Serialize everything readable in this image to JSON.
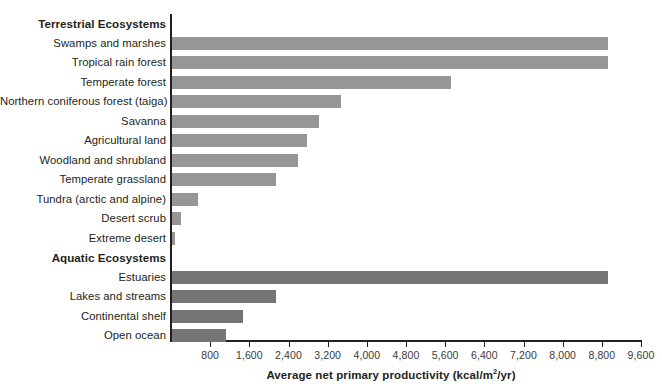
{
  "chart_data": {
    "type": "bar",
    "orientation": "horizontal",
    "title": "",
    "xlabel": "Average net primary productivity (kcal/m2/yr)",
    "xlabel_display": "Average net primary productivity (kcal/m",
    "xlabel_sup": "2",
    "xlabel_tail": "/yr)",
    "ylabel": "",
    "xlim": [
      0,
      9600
    ],
    "grid": false,
    "legend": "none",
    "tick_values": [
      800,
      1600,
      2400,
      3200,
      4000,
      4800,
      5600,
      6400,
      7200,
      8000,
      8800,
      9600
    ],
    "tick_labels": [
      "800",
      "1,600",
      "2,400",
      "3,200",
      "4,000",
      "4,800",
      "5,600",
      "6,400",
      "7,200",
      "8,000",
      "8,800",
      "9,600"
    ],
    "sections": [
      {
        "name": "Terrestrial Ecosystems",
        "group": "terrestrial",
        "color": "#969696"
      },
      {
        "name": "Aquatic Ecosystems",
        "group": "aquatic",
        "color": "#757575"
      }
    ],
    "categories": [
      "Swamps and marshes",
      "Tropical rain forest",
      "Temperate forest",
      "Northern coniferous forest (taiga)",
      "Savanna",
      "Agricultural land",
      "Woodland and shrubland",
      "Temperate grassland",
      "Tundra (arctic and alpine)",
      "Desert scrub",
      "Extreme desert",
      "Estuaries",
      "Lakes and streams",
      "Continental shelf",
      "Open ocean"
    ],
    "values": [
      8900,
      8900,
      5700,
      3450,
      3000,
      2750,
      2570,
      2120,
      530,
      190,
      60,
      8900,
      2120,
      1450,
      1100
    ]
  },
  "rows": [
    {
      "label": "Terrestrial Ecosystems",
      "type": "section",
      "group": "terrestrial"
    },
    {
      "label": "Swamps and marshes",
      "value": 8900,
      "group": "terrestrial"
    },
    {
      "label": "Tropical rain forest",
      "value": 8900,
      "group": "terrestrial"
    },
    {
      "label": "Temperate forest",
      "value": 5700,
      "group": "terrestrial"
    },
    {
      "label": "Northern coniferous forest (taiga)",
      "value": 3450,
      "group": "terrestrial"
    },
    {
      "label": "Savanna",
      "value": 3000,
      "group": "terrestrial"
    },
    {
      "label": "Agricultural land",
      "value": 2750,
      "group": "terrestrial"
    },
    {
      "label": "Woodland and shrubland",
      "value": 2570,
      "group": "terrestrial"
    },
    {
      "label": "Temperate grassland",
      "value": 2120,
      "group": "terrestrial"
    },
    {
      "label": "Tundra (arctic and alpine)",
      "value": 530,
      "group": "terrestrial"
    },
    {
      "label": "Desert scrub",
      "value": 190,
      "group": "terrestrial"
    },
    {
      "label": "Extreme desert",
      "value": 60,
      "group": "terrestrial"
    },
    {
      "label": "Aquatic Ecosystems",
      "type": "section",
      "group": "aquatic"
    },
    {
      "label": "Estuaries",
      "value": 8900,
      "group": "aquatic"
    },
    {
      "label": "Lakes and streams",
      "value": 2120,
      "group": "aquatic"
    },
    {
      "label": "Continental shelf",
      "value": 1450,
      "group": "aquatic"
    },
    {
      "label": "Open ocean",
      "value": 1100,
      "group": "aquatic"
    }
  ],
  "colors": {
    "terrestrial_bar": "#969696",
    "aquatic_bar": "#757575",
    "axis": "#231f20",
    "text": "#231f20",
    "tick_text": "#3a3a3a",
    "background": "#ffffff"
  }
}
